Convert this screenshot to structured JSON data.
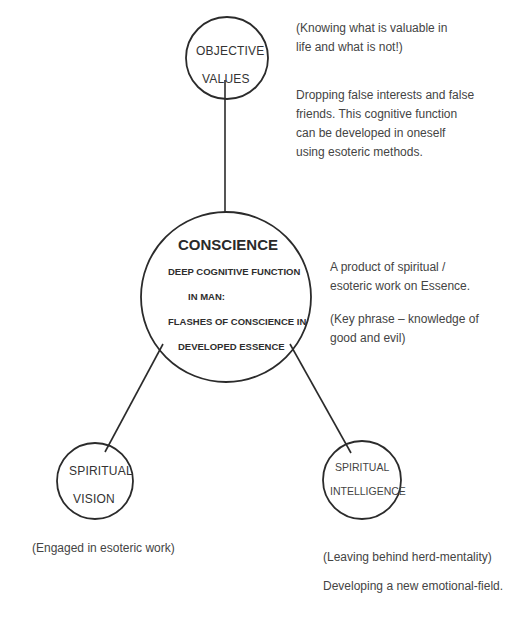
{
  "diagram": {
    "nodes": {
      "objective_values": {
        "line1": "OBJECTIVE",
        "line2": "VALUES",
        "notes": {
          "note1_line1": "(Knowing what is valuable in",
          "note1_line2": "life and what is not!)",
          "note2_line1": "Dropping false interests and false",
          "note2_line2": "friends. This cognitive function",
          "note2_line3": "can be developed in oneself",
          "note2_line4": "using esoteric methods."
        }
      },
      "conscience": {
        "title": "CONSCIENCE",
        "line1": "DEEP COGNITIVE FUNCTION",
        "line2": "IN MAN:",
        "line3": "FLASHES OF CONSCIENCE IN",
        "line4": "DEVELOPED ESSENCE",
        "notes": {
          "note1_line1": "A product of spiritual /",
          "note1_line2": "esoteric work on Essence.",
          "note2_line1": "(Key phrase – knowledge of",
          "note2_line2": "good and evil)"
        }
      },
      "spiritual_vision": {
        "line1": "SPIRITUAL",
        "line2": "VISION",
        "notes": {
          "note1": "(Engaged in esoteric work)"
        }
      },
      "spiritual_intelligence": {
        "line1": "SPIRITUAL",
        "line2": "INTELLIGENCE",
        "notes": {
          "note1": "(Leaving behind herd-mentality)",
          "note2": "Developing a new emotional-field."
        }
      }
    },
    "colors": {
      "stroke": "#2b2b2b",
      "text": "#3a3a3a",
      "background": "#ffffff"
    }
  }
}
